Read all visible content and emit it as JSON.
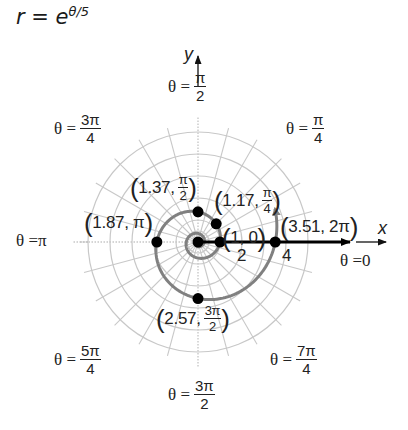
{
  "title": {
    "lhs": "r",
    "eq": " = ",
    "base": "e",
    "exponent": "θ/5"
  },
  "axes": {
    "x_label": "x",
    "y_label": "y"
  },
  "angle_labels": [
    {
      "id": "theta-0",
      "prefix": "θ = ",
      "value": "0"
    },
    {
      "id": "theta-pi-4",
      "prefix": "θ = ",
      "num": "π",
      "den": "4"
    },
    {
      "id": "theta-pi-2",
      "prefix": "θ = ",
      "num": "π",
      "den": "2"
    },
    {
      "id": "theta-3pi-4",
      "prefix": "θ = ",
      "num": "3π",
      "den": "4"
    },
    {
      "id": "theta-pi",
      "prefix": "θ = ",
      "value": "π"
    },
    {
      "id": "theta-5pi-4",
      "prefix": "θ = ",
      "num": "5π",
      "den": "4"
    },
    {
      "id": "theta-3pi-2",
      "prefix": "θ = ",
      "num": "3π",
      "den": "2"
    },
    {
      "id": "theta-7pi-4",
      "prefix": "θ = ",
      "num": "7π",
      "den": "4"
    }
  ],
  "radial_ticks": [
    "2",
    "4"
  ],
  "point_labels": [
    {
      "r": "1",
      "theta": "0"
    },
    {
      "r": "1.17",
      "theta_num": "π",
      "theta_den": "4"
    },
    {
      "r": "1.37",
      "theta_num": "π",
      "theta_den": "2"
    },
    {
      "r": "1.87",
      "theta": "π"
    },
    {
      "r": "2.57",
      "theta_num": "3π",
      "theta_den": "2"
    },
    {
      "r": "3.51",
      "theta": "2π"
    }
  ],
  "colors": {
    "curve": "#808080",
    "grid": "#c8c8c8",
    "points": "#000000",
    "ray": "#000000",
    "text": "#222222"
  },
  "chart_data": {
    "type": "polar",
    "xlabel": "x",
    "ylabel": "y",
    "curve": "r = e^(θ/5) (logarithmic spiral)",
    "points": [
      {
        "r": 1.0,
        "theta": "0",
        "theta_rad": 0
      },
      {
        "r": 1.17,
        "theta": "π/4",
        "theta_rad": 0.7854
      },
      {
        "r": 1.37,
        "theta": "π/2",
        "theta_rad": 1.5708
      },
      {
        "r": 1.87,
        "theta": "π",
        "theta_rad": 3.1416
      },
      {
        "r": 2.57,
        "theta": "3π/2",
        "theta_rad": 4.7124
      },
      {
        "r": 3.51,
        "theta": "2π",
        "theta_rad": 6.2832
      }
    ],
    "angle_labels": [
      "θ = 0",
      "θ = π/4",
      "θ = π/2",
      "θ = 3π/4",
      "θ = π",
      "θ = 5π/4",
      "θ = 3π/2",
      "θ = 7π/4"
    ],
    "radial_tick_labels": [
      2,
      4
    ],
    "radial_rings": [
      1,
      2,
      3,
      4,
      5
    ],
    "radial_spokes_every": "π/12",
    "rlim": [
      0,
      5
    ],
    "grid": true
  }
}
